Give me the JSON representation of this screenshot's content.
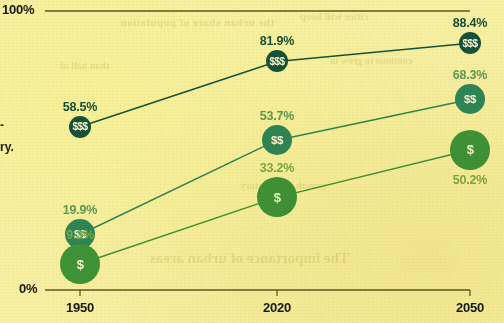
{
  "chart_data": {
    "type": "line",
    "title": "",
    "xlabel": "",
    "ylabel": "",
    "x": [
      "1950",
      "2020",
      "2050"
    ],
    "categories": [
      "1950",
      "2020",
      "2050"
    ],
    "ylim": [
      0,
      100
    ],
    "ytick_labels": [
      "0%",
      "100%"
    ],
    "grid": false,
    "legend_position": "none",
    "series": [
      {
        "name": "$$$",
        "marker_label": "$$$",
        "color": "#17513b",
        "label_color": "#17513b",
        "values": [
          58.5,
          81.9,
          88.4
        ],
        "value_labels": [
          "58.5%",
          "81.9%",
          "88.4%"
        ]
      },
      {
        "name": "$$",
        "marker_label": "$$",
        "color": "#2f8659",
        "label_color": "#5f9a57",
        "values": [
          19.9,
          53.7,
          68.3
        ],
        "value_labels": [
          "19.9%",
          "53.7%",
          "68.3%"
        ]
      },
      {
        "name": "$",
        "marker_label": "$",
        "color": "#3f9438",
        "label_color": "#7ea84a",
        "values": [
          9.3,
          33.2,
          50.2
        ],
        "value_labels": [
          "9.3%",
          "33.2%",
          "50.2%"
        ]
      }
    ]
  },
  "axis": {
    "y_top_label": "100%",
    "y_bottom_label": "0%",
    "x_ticks": [
      "1950",
      "2020",
      "2050"
    ]
  },
  "margin_text": {
    "fragment_1": "-",
    "fragment_2": "ry."
  },
  "background_showthrough": {
    "line_1": "The importance of urban areas",
    "line_2": "the urban share of population",
    "line_3": "cities will keep",
    "line_4": "continue to grow in",
    "line_5": "than half of",
    "line_6": "growth next century"
  },
  "colors": {
    "page_background": "#f7f0a3",
    "axis_line": "#5f5a24",
    "tier3": "#17513b",
    "tier2": "#2f8659",
    "tier1": "#3f9438",
    "text": "#17170f"
  }
}
